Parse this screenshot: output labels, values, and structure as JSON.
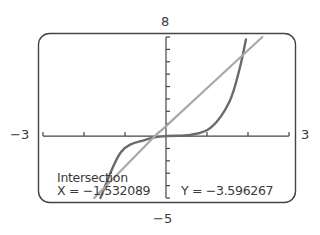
{
  "chart_data": {
    "type": "line",
    "title": "",
    "xlabel": "",
    "ylabel": "",
    "xlim": [
      -3,
      3
    ],
    "ylim": [
      -5,
      8
    ],
    "window_labels": {
      "ymax": "8",
      "ymin": "−5",
      "xmin": "−3",
      "xmax": "3"
    },
    "xscale_ticks": 1,
    "yscale_ticks": 1,
    "grid": false,
    "series": [
      {
        "name": "cubic curve",
        "color": "#6a6a6a",
        "points": [
          [
            -1.6,
            -5
          ],
          [
            -1.1,
            -1.3
          ],
          [
            -0.5,
            -0.3
          ],
          [
            0,
            0
          ],
          [
            0.6,
            0.1
          ],
          [
            1.1,
            0.7
          ],
          [
            1.55,
            2.8
          ],
          [
            1.8,
            5.5
          ],
          [
            1.95,
            7.8
          ]
        ]
      },
      {
        "name": "line",
        "color": "#a8a8a8",
        "points": [
          [
            -1.75,
            -5
          ],
          [
            -0.27,
            0
          ],
          [
            0,
            0.8
          ],
          [
            2.35,
            8
          ]
        ]
      }
    ],
    "annotation": {
      "label": "Intersection",
      "x_text": "X = −1.532089",
      "y_text": "Y = −3.596267",
      "x": -1.532089,
      "y": -3.596267
    }
  }
}
